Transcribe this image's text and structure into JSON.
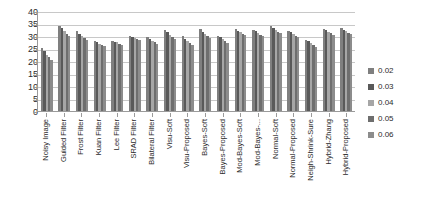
{
  "chart_data": {
    "type": "bar",
    "title": "",
    "xlabel": "",
    "ylabel": "",
    "ylim": [
      0,
      40
    ],
    "yticks": [
      40,
      35,
      30,
      25,
      20,
      15,
      10,
      5,
      0
    ],
    "grid": true,
    "legend_position": "right",
    "categories": [
      "Noisy Image",
      "Guided Filter",
      "Frost Filter",
      "Kuan Filter",
      "Lee Filter",
      "SRAD Filter",
      "Bilateral Filter",
      "Visu-Soft",
      "Visu-Proposed",
      "Bayes-Soft",
      "Bayes-Proposed",
      "Mod-Bayes-Soft",
      "Mod-Bayes-...",
      "Normal-Soft",
      "Normal-Proposed",
      "Neigh-Shrink-Sure",
      "Hybrid-Zhang",
      "Hybrid-Proposed"
    ],
    "series": [
      {
        "name": "0.02",
        "color": "#7f7f7f",
        "values": [
          25.3,
          34.2,
          32.0,
          28.0,
          28.2,
          30.0,
          29.5,
          32.5,
          30.0,
          32.8,
          30.2,
          32.8,
          32.5,
          33.9,
          32.0,
          28.6,
          33.0,
          33.2
        ]
      },
      {
        "name": "0.03",
        "color": "#595959",
        "values": [
          24.2,
          33.2,
          31.0,
          27.5,
          27.8,
          29.5,
          29.0,
          31.5,
          29.0,
          31.8,
          29.5,
          32.2,
          32.0,
          33.2,
          31.5,
          28.0,
          32.4,
          32.6
        ]
      },
      {
        "name": "0.04",
        "color": "#a6a6a6",
        "values": [
          22.6,
          32.0,
          30.2,
          27.0,
          27.5,
          29.2,
          28.2,
          30.5,
          28.0,
          31.0,
          28.8,
          31.5,
          31.2,
          32.5,
          30.8,
          27.4,
          31.8,
          32.0
        ]
      },
      {
        "name": "0.05",
        "color": "#6e6e6e",
        "values": [
          21.5,
          31.0,
          29.4,
          26.4,
          27.0,
          28.8,
          27.5,
          29.6,
          27.2,
          30.2,
          28.0,
          31.0,
          30.6,
          31.8,
          30.2,
          26.6,
          31.2,
          31.4
        ]
      },
      {
        "name": "0.06",
        "color": "#8c8c8c",
        "values": [
          20.5,
          30.0,
          28.6,
          26.0,
          26.6,
          28.4,
          26.8,
          28.8,
          26.4,
          29.4,
          27.2,
          30.4,
          30.0,
          31.2,
          29.6,
          25.8,
          30.6,
          30.8
        ]
      }
    ]
  }
}
